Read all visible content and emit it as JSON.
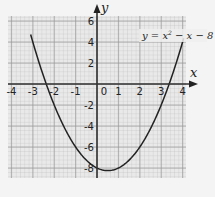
{
  "chart_data": {
    "type": "line",
    "title": "",
    "annotation": "y = x² − x − 8",
    "xlabel": "x",
    "ylabel": "y",
    "xlim": [
      -4,
      4
    ],
    "ylim": [
      -8,
      6
    ],
    "x_ticks": [
      "-4",
      "-3",
      "-2",
      "-1",
      "0",
      "1",
      "2",
      "3",
      "4"
    ],
    "y_ticks": [
      "6",
      "4",
      "2",
      "-2",
      "-4",
      "-6",
      "-8"
    ],
    "grid": true,
    "series": [
      {
        "name": "y = x² − x − 8",
        "function": "x^2 - x - 8",
        "x": [
          -3.0,
          -2.5,
          -2.0,
          -1.5,
          -1.0,
          -0.5,
          0.0,
          0.5,
          1.0,
          1.5,
          2.0,
          2.5,
          3.0,
          3.5,
          4.0
        ],
        "y": [
          4.0,
          0.75,
          -2.0,
          -4.25,
          -6.0,
          -7.25,
          -8.0,
          -8.25,
          -8.0,
          -7.25,
          -6.0,
          -4.25,
          -2.0,
          0.75,
          4.0
        ]
      }
    ],
    "roots": [
      -2.37,
      3.37
    ],
    "vertex": [
      0.5,
      -8.25
    ]
  },
  "labels": {
    "x_axis": "x",
    "y_axis": "y",
    "equation_prefix": "y = x",
    "equation_exp": "2",
    "equation_suffix": " − x − 8",
    "origin": "0"
  }
}
